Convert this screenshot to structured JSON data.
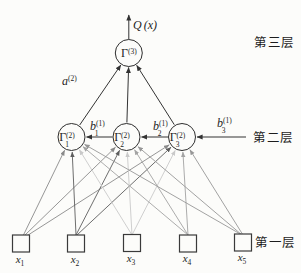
{
  "figure": {
    "output": {
      "symbol": "Q",
      "arg": "(x)"
    },
    "layer3_node": {
      "symbol": "Γ",
      "sup": "(3)"
    },
    "layer2_nodes": [
      {
        "symbol": "Γ",
        "sub": "1",
        "sup": "(2)"
      },
      {
        "symbol": "Γ",
        "sub": "2",
        "sup": "(2)"
      },
      {
        "symbol": "Γ",
        "sub": "3",
        "sup": "(2)"
      }
    ],
    "inputs": [
      {
        "symbol": "x",
        "sub": "1"
      },
      {
        "symbol": "x",
        "sub": "2"
      },
      {
        "symbol": "x",
        "sub": "3"
      },
      {
        "symbol": "x",
        "sub": "4"
      },
      {
        "symbol": "x",
        "sub": "5"
      }
    ],
    "edge_labels": {
      "a": {
        "symbol": "a",
        "sup": "(2)"
      },
      "b1": {
        "symbol": "b",
        "sub": "1",
        "sup": "(1)"
      },
      "b2": {
        "symbol": "b",
        "sub": "2",
        "sup": "(1)"
      },
      "b3": {
        "symbol": "b",
        "sub": "3",
        "sup": "(1)"
      }
    },
    "layer_labels": {
      "layer3": "第三层",
      "layer2": "第二层",
      "layer1": "第一层"
    },
    "colors": {
      "line_dark": "#333333",
      "input_line_grays": [
        "#8a8a8a",
        "#5d5d5d",
        "#c9c9c9",
        "#a3a3a3",
        "#979797"
      ],
      "background": "#fcfcfa"
    }
  }
}
